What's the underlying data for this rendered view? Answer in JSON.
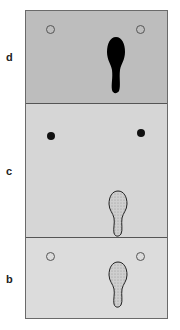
{
  "figure": {
    "panels": [
      {
        "label": "d",
        "markers": "open",
        "footprint": "solid-black"
      },
      {
        "label": "c",
        "markers": "filled",
        "footprint": "stippled-outline"
      },
      {
        "label": "b",
        "markers": "open",
        "footprint": "stippled-outline"
      }
    ],
    "colors": {
      "panel_d_bg": "#bdbdbd",
      "panel_c_bg": "#d6d6d6",
      "panel_b_bg": "#dcdcdc",
      "footprint_solid": "#000000",
      "footprint_stipple": "#c8c8c8"
    }
  }
}
